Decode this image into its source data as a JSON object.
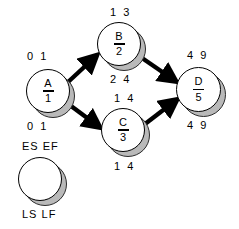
{
  "diagram": {
    "nodes": [
      {
        "id": "A",
        "label": "A",
        "duration": "1",
        "es": "0",
        "ef": "1",
        "ls": "0",
        "lf": "1",
        "top_label": "0 1",
        "bottom_label": "0 1"
      },
      {
        "id": "B",
        "label": "B",
        "duration": "2",
        "es": "1",
        "ef": "3",
        "ls": "2",
        "lf": "4",
        "top_label": "1 3",
        "bottom_label": "2 4"
      },
      {
        "id": "C",
        "label": "C",
        "duration": "3",
        "es": "1",
        "ef": "4",
        "ls": "1",
        "lf": "4",
        "top_label": "1 4",
        "bottom_label": "1 4"
      },
      {
        "id": "D",
        "label": "D",
        "duration": "5",
        "es": "4",
        "ef": "9",
        "ls": "4",
        "lf": "9",
        "top_label": "4 9",
        "bottom_label": "4 9"
      }
    ],
    "edges": [
      {
        "from": "A",
        "to": "B"
      },
      {
        "from": "A",
        "to": "C"
      },
      {
        "from": "B",
        "to": "D"
      },
      {
        "from": "C",
        "to": "D"
      }
    ],
    "legend": {
      "top_label": "ES  EF",
      "bottom_label": "LS  LF",
      "node_label": ""
    },
    "colors": {
      "node_fill": "#ffffff",
      "node_stroke": "#000000",
      "shadow": "#b9b9b9",
      "arrow": "#000000",
      "text": "#000000",
      "background": "#ffffff"
    }
  }
}
